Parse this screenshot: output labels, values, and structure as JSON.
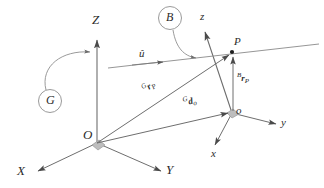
{
  "figure": {
    "type": "kinematics-frame-diagram",
    "background_color": "#ffffff",
    "stroke_color": "#6e6e6e",
    "text_color": "#2b2b2b",
    "marker_color": "#b8b8b8"
  },
  "global_frame": {
    "name_label": "G",
    "origin_label": "O",
    "axes": [
      {
        "label": "Z",
        "direction": "up"
      },
      {
        "label": "X",
        "direction": "down-left"
      },
      {
        "label": "Y",
        "direction": "down-right"
      }
    ]
  },
  "body_frame": {
    "name_label": "B",
    "origin_label": "o",
    "axes": [
      {
        "label": "z",
        "direction": "up"
      },
      {
        "label": "x",
        "direction": "down-left"
      },
      {
        "label": "y",
        "direction": "right"
      }
    ]
  },
  "points": [
    {
      "label": "P"
    }
  ],
  "vectors": [
    {
      "name": "global-position-of-P",
      "pre": "G",
      "symbol": "r",
      "sub": "P"
    },
    {
      "name": "body-position-of-P",
      "pre": "B",
      "symbol": "r",
      "sub": "P"
    },
    {
      "name": "global-position-of-body-origin",
      "pre": "G",
      "symbol": "d",
      "sub": "o"
    }
  ],
  "line": {
    "unit_vector_label": "û"
  }
}
